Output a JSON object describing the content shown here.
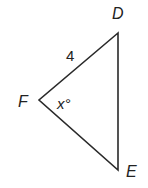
{
  "diagram": {
    "type": "triangle",
    "vertices": {
      "D": {
        "label": "D",
        "x": 118,
        "y": 33
      },
      "F": {
        "label": "F",
        "x": 39,
        "y": 100
      },
      "E": {
        "label": "E",
        "x": 118,
        "y": 170
      }
    },
    "side_FD_label": "4",
    "angle_F_label": "x°",
    "stroke_color": "#2a2a2a"
  }
}
